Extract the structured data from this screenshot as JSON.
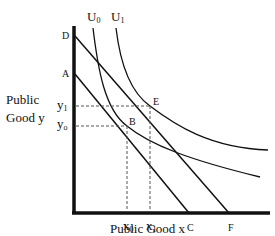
{
  "diagram": {
    "y_axis_label_line1": "Public",
    "y_axis_label_line2": "Good y",
    "x_axis_label": "Public Good x",
    "curves": {
      "u0": {
        "base": "U",
        "sub": "0"
      },
      "u1": {
        "base": "U",
        "sub": "1"
      }
    },
    "points": {
      "D": "D",
      "A": "A",
      "B": "B",
      "E": "E",
      "C": "C",
      "F": "F"
    },
    "y_ticks": {
      "y1": {
        "base": "y",
        "sub": "1"
      },
      "y0": {
        "base": "y",
        "sub": "o"
      }
    },
    "x_ticks": {
      "x0": {
        "base": "x",
        "sub": "0"
      },
      "x1": {
        "base": "x",
        "sub": "1"
      }
    },
    "colors": {
      "line": "#111111",
      "background": "#ffffff"
    }
  }
}
